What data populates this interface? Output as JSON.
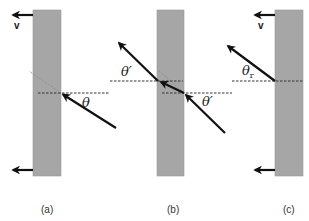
{
  "figure": {
    "colors": {
      "mirror": "#a6a6a6",
      "ray": "#111111",
      "normal_dashed": "#333333"
    },
    "panels": [
      {
        "id": "a",
        "label": "(a)",
        "angle_label": "θ",
        "velocity_label": "v",
        "rays": [
          "incident ray at angle θ"
        ]
      },
      {
        "id": "b",
        "label": "(b)",
        "angle_labels": [
          "θ′",
          "θ′"
        ],
        "rays": [
          "incident ray at angle θ′",
          "reflected ray at angle θ′"
        ]
      },
      {
        "id": "c",
        "label": "(c)",
        "angle_label": "θ",
        "angle_subscript": "r",
        "velocity_label": "v",
        "rays": [
          "reflected ray at angle θr"
        ]
      }
    ]
  }
}
